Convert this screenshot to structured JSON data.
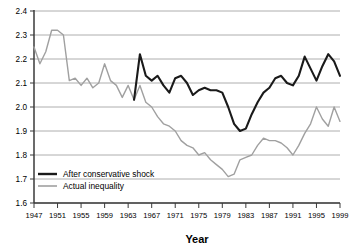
{
  "chart_data": {
    "type": "line",
    "title": "",
    "xlabel": "Year",
    "ylabel": "",
    "xlim": [
      1947,
      1999
    ],
    "ylim": [
      1.6,
      2.4
    ],
    "grid": true,
    "legend_position": "inside-bottom-left",
    "ytick_labels": [
      "1.6",
      "1.7",
      "1.8",
      "1.9",
      "2.0",
      "2.1",
      "2.2",
      "2.3",
      "2.4"
    ],
    "ytick_values": [
      1.6,
      1.7,
      1.8,
      1.9,
      2.0,
      2.1,
      2.2,
      2.3,
      2.4
    ],
    "xtick_labels": [
      "1947",
      "1951",
      "1955",
      "1959",
      "1963",
      "1967",
      "1971",
      "1975",
      "1979",
      "1983",
      "1987",
      "1991",
      "1995",
      "1999"
    ],
    "xtick_values": [
      1947,
      1951,
      1955,
      1959,
      1963,
      1967,
      1971,
      1975,
      1979,
      1983,
      1987,
      1991,
      1995,
      1999
    ],
    "colors": {
      "after_conservative_shock": "#1a1a1a",
      "actual_inequality": "#a0a0a0",
      "gridline": "#9a9a9a",
      "axis": "#3a3a3a"
    },
    "series": [
      {
        "name": "Actual inequality",
        "color": "#a0a0a0",
        "x": [
          1947,
          1948,
          1949,
          1950,
          1951,
          1952,
          1953,
          1954,
          1955,
          1956,
          1957,
          1958,
          1959,
          1960,
          1961,
          1962,
          1963,
          1964,
          1965,
          1966,
          1967,
          1968,
          1969,
          1970,
          1971,
          1972,
          1973,
          1974,
          1975,
          1976,
          1977,
          1978,
          1979,
          1980,
          1981,
          1982,
          1983,
          1984,
          1985,
          1986,
          1987,
          1988,
          1989,
          1990,
          1991,
          1992,
          1993,
          1994,
          1995,
          1996,
          1997,
          1998,
          1999
        ],
        "values": [
          2.25,
          2.18,
          2.23,
          2.32,
          2.32,
          2.3,
          2.11,
          2.12,
          2.09,
          2.12,
          2.08,
          2.1,
          2.18,
          2.11,
          2.09,
          2.04,
          2.09,
          2.03,
          2.09,
          2.02,
          2.0,
          1.96,
          1.93,
          1.92,
          1.9,
          1.86,
          1.84,
          1.83,
          1.8,
          1.81,
          1.78,
          1.76,
          1.74,
          1.71,
          1.72,
          1.78,
          1.79,
          1.8,
          1.84,
          1.87,
          1.86,
          1.86,
          1.85,
          1.83,
          1.8,
          1.84,
          1.89,
          1.93,
          2.0,
          1.95,
          1.92,
          2.0,
          1.94
        ]
      },
      {
        "name": "After conservative shock",
        "color": "#1a1a1a",
        "x": [
          1964,
          1965,
          1966,
          1967,
          1968,
          1969,
          1970,
          1971,
          1972,
          1973,
          1974,
          1975,
          1976,
          1977,
          1978,
          1979,
          1980,
          1981,
          1982,
          1983,
          1984,
          1985,
          1986,
          1987,
          1988,
          1989,
          1990,
          1991,
          1992,
          1993,
          1994,
          1995,
          1996,
          1997,
          1998,
          1999
        ],
        "values": [
          2.03,
          2.22,
          2.13,
          2.11,
          2.13,
          2.09,
          2.06,
          2.12,
          2.13,
          2.1,
          2.05,
          2.07,
          2.08,
          2.07,
          2.07,
          2.06,
          2.0,
          1.93,
          1.9,
          1.91,
          1.97,
          2.02,
          2.06,
          2.08,
          2.12,
          2.13,
          2.1,
          2.09,
          2.13,
          2.21,
          2.16,
          2.11,
          2.17,
          2.22,
          2.19,
          2.13
        ]
      }
    ],
    "legend": [
      {
        "label": "After conservative shock",
        "color": "#1a1a1a",
        "width": 2.4
      },
      {
        "label": "Actual inequality",
        "color": "#a0a0a0",
        "width": 1.6
      }
    ]
  }
}
